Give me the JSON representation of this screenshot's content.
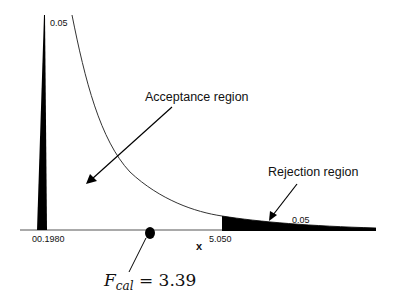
{
  "diagram": {
    "type": "F-distribution hypothesis test",
    "labels": {
      "left_tail_prob": "0.05",
      "left_critical": "00.1980",
      "right_critical": "5.050",
      "right_tail_prob": "0.05",
      "x_axis": "x",
      "acceptance": "Acceptance region",
      "rejection": "Rejection region",
      "fcal_symbol": "F",
      "fcal_sub": "cal",
      "fcal_value": "= 3.39"
    },
    "colors": {
      "ink": "#000000",
      "curve": "#333333",
      "background": "#ffffff"
    }
  }
}
